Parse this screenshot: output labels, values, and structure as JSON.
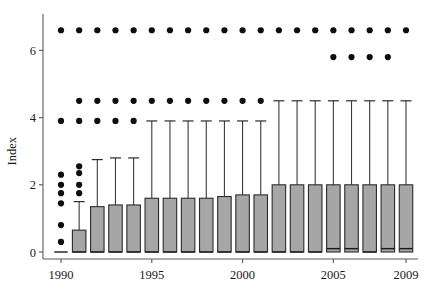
{
  "chart_data": {
    "type": "box",
    "title": "",
    "xlabel": "",
    "ylabel": "Index",
    "ylim": [
      -0.35,
      7.1
    ],
    "yticks": [
      0,
      2,
      4,
      6
    ],
    "ytick_labels": [
      "0",
      "2",
      "4",
      "6"
    ],
    "xlim": [
      1989.4,
      2009.6
    ],
    "xticks": [
      1990,
      1995,
      2000,
      2005,
      2009
    ],
    "xtick_labels": [
      "1990",
      "1995",
      "2000",
      "2005",
      "2009"
    ],
    "grid": false,
    "legend": null,
    "categories": [
      1990,
      1991,
      1992,
      1993,
      1994,
      1995,
      1996,
      1997,
      1998,
      1999,
      2000,
      2001,
      2002,
      2003,
      2004,
      2005,
      2006,
      2007,
      2008,
      2009
    ],
    "boxes": [
      {
        "year": 1990,
        "q1": 0.0,
        "median": 0.0,
        "q3": 0.0,
        "whisker_low": 0.0,
        "whisker_high": 0.0,
        "outliers": [
          0.3,
          0.8,
          1.45,
          1.75,
          2.0,
          2.3,
          3.9,
          6.6
        ]
      },
      {
        "year": 1991,
        "q1": 0.0,
        "median": 0.0,
        "q3": 0.65,
        "whisker_low": 0.0,
        "whisker_high": 1.5,
        "outliers": [
          1.75,
          2.0,
          2.35,
          2.55,
          3.9,
          4.5,
          6.6
        ]
      },
      {
        "year": 1992,
        "q1": 0.0,
        "median": 0.0,
        "q3": 1.35,
        "whisker_low": 0.0,
        "whisker_high": 2.75,
        "outliers": [
          3.9,
          4.5,
          6.6
        ]
      },
      {
        "year": 1993,
        "q1": 0.0,
        "median": 0.0,
        "q3": 1.4,
        "whisker_low": 0.0,
        "whisker_high": 2.8,
        "outliers": [
          3.9,
          4.5,
          6.6
        ]
      },
      {
        "year": 1994,
        "q1": 0.0,
        "median": 0.0,
        "q3": 1.4,
        "whisker_low": 0.0,
        "whisker_high": 2.8,
        "outliers": [
          3.9,
          4.5,
          6.6
        ]
      },
      {
        "year": 1995,
        "q1": 0.0,
        "median": 0.0,
        "q3": 1.6,
        "whisker_low": 0.0,
        "whisker_high": 3.9,
        "outliers": [
          4.5,
          6.6
        ]
      },
      {
        "year": 1996,
        "q1": 0.0,
        "median": 0.0,
        "q3": 1.6,
        "whisker_low": 0.0,
        "whisker_high": 3.9,
        "outliers": [
          4.5,
          6.6
        ]
      },
      {
        "year": 1997,
        "q1": 0.0,
        "median": 0.0,
        "q3": 1.6,
        "whisker_low": 0.0,
        "whisker_high": 3.9,
        "outliers": [
          4.5,
          6.6
        ]
      },
      {
        "year": 1998,
        "q1": 0.0,
        "median": 0.0,
        "q3": 1.6,
        "whisker_low": 0.0,
        "whisker_high": 3.9,
        "outliers": [
          4.5,
          6.6
        ]
      },
      {
        "year": 1999,
        "q1": 0.0,
        "median": 0.0,
        "q3": 1.65,
        "whisker_low": 0.0,
        "whisker_high": 3.9,
        "outliers": [
          4.5,
          6.6
        ]
      },
      {
        "year": 2000,
        "q1": 0.0,
        "median": 0.0,
        "q3": 1.7,
        "whisker_low": 0.0,
        "whisker_high": 3.9,
        "outliers": [
          4.5,
          6.6
        ]
      },
      {
        "year": 2001,
        "q1": 0.0,
        "median": 0.0,
        "q3": 1.7,
        "whisker_low": 0.0,
        "whisker_high": 3.9,
        "outliers": [
          4.5,
          6.6
        ]
      },
      {
        "year": 2002,
        "q1": 0.0,
        "median": 0.0,
        "q3": 2.0,
        "whisker_low": 0.0,
        "whisker_high": 4.5,
        "outliers": [
          6.6
        ]
      },
      {
        "year": 2003,
        "q1": 0.0,
        "median": 0.0,
        "q3": 2.0,
        "whisker_low": 0.0,
        "whisker_high": 4.5,
        "outliers": [
          6.6
        ]
      },
      {
        "year": 2004,
        "q1": 0.0,
        "median": 0.0,
        "q3": 2.0,
        "whisker_low": 0.0,
        "whisker_high": 4.5,
        "outliers": [
          6.6
        ]
      },
      {
        "year": 2005,
        "q1": 0.0,
        "median": 0.1,
        "q3": 2.0,
        "whisker_low": 0.0,
        "whisker_high": 4.5,
        "outliers": [
          5.8,
          6.6
        ]
      },
      {
        "year": 2006,
        "q1": 0.0,
        "median": 0.1,
        "q3": 2.0,
        "whisker_low": 0.0,
        "whisker_high": 4.5,
        "outliers": [
          5.8,
          6.6
        ]
      },
      {
        "year": 2007,
        "q1": 0.0,
        "median": 0.0,
        "q3": 2.0,
        "whisker_low": 0.0,
        "whisker_high": 4.5,
        "outliers": [
          5.8,
          6.6
        ]
      },
      {
        "year": 2008,
        "q1": 0.0,
        "median": 0.1,
        "q3": 2.0,
        "whisker_low": 0.0,
        "whisker_high": 4.5,
        "outliers": [
          5.8,
          6.6
        ]
      },
      {
        "year": 2009,
        "q1": 0.0,
        "median": 0.1,
        "q3": 2.0,
        "whisker_low": 0.0,
        "whisker_high": 4.5,
        "outliers": [
          6.6
        ]
      }
    ],
    "colors": {
      "box_fill": "#a6a6a6",
      "box_stroke": "#2b2b2b",
      "whisker": "#3a3a3a",
      "outlier": "#0d0d0d",
      "axis": "#59595b",
      "text": "#1a1a1a",
      "background": "#ffffff"
    }
  }
}
